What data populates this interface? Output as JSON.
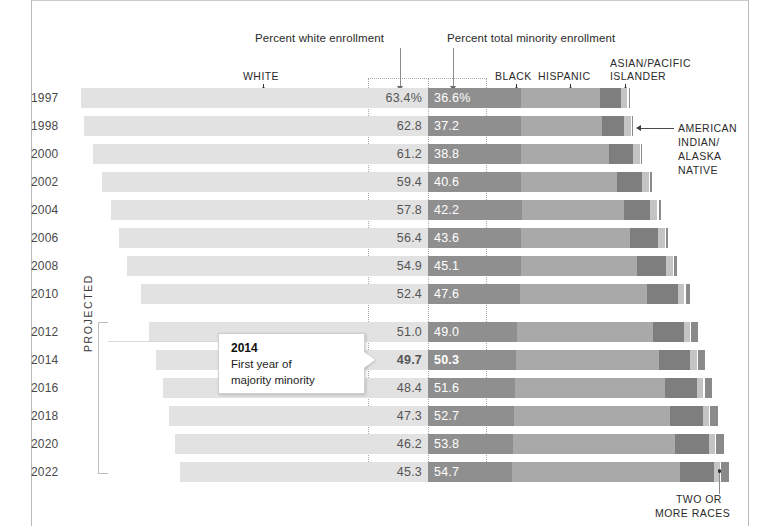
{
  "annotations": {
    "white_enrollment": "Percent white enrollment",
    "minority_enrollment": "Percent total minority enrollment",
    "projected": "PROJECTED",
    "american_indian": "AMERICAN\nINDIAN/\nALASKA\nNATIVE",
    "american_indian_lines": [
      "AMERICAN",
      "INDIAN/",
      "ALASKA",
      "NATIVE"
    ],
    "two_or_more_lines": [
      "TWO OR",
      "MORE RACES"
    ]
  },
  "callout": {
    "title": "2014",
    "line1": "First year of",
    "line2": "majority minority"
  },
  "legend": {
    "white": "WHITE",
    "black": "BLACK",
    "hispanic": "HISPANIC",
    "asian_line1": "ASIAN/PACIFIC",
    "asian_line2": "ISLANDER"
  },
  "colors": {
    "white": "#e2e2e2",
    "black": "#8f8f8f",
    "hispanic": "#a9a9a9",
    "asian": "#7e7e7e",
    "american_indian": "#c4c4c4",
    "two_or_more": "#8a8a8a",
    "background": "#ffffff",
    "text": "#2b2b2b"
  },
  "chart_data": {
    "type": "bar",
    "title": "",
    "xlabel": "",
    "ylabel": "",
    "orientation": "horizontal",
    "stacked": true,
    "grid": false,
    "legend_position": "top",
    "categories": [
      "1997",
      "1998",
      "2000",
      "2002",
      "2004",
      "2006",
      "2008",
      "2010",
      "2012",
      "2014",
      "2016",
      "2018",
      "2020",
      "2022"
    ],
    "projected_categories": [
      "2012",
      "2014",
      "2016",
      "2018",
      "2020",
      "2022"
    ],
    "series": [
      {
        "name": "WHITE",
        "values": [
          63.4,
          62.8,
          61.2,
          59.4,
          57.8,
          56.4,
          54.9,
          52.4,
          51.0,
          49.7,
          48.4,
          47.3,
          46.2,
          45.3
        ]
      },
      {
        "name": "TOTAL MINORITY",
        "values": [
          36.6,
          37.2,
          38.8,
          40.6,
          42.2,
          43.6,
          45.1,
          47.6,
          49.0,
          50.3,
          51.6,
          52.7,
          53.8,
          54.7
        ]
      },
      {
        "name": "BLACK",
        "values": [
          16.9,
          16.9,
          17.0,
          17.0,
          17.1,
          17.0,
          16.9,
          16.7,
          16.3,
          16.1,
          15.9,
          15.7,
          15.5,
          15.3
        ]
      },
      {
        "name": "HISPANIC",
        "values": [
          14.4,
          14.9,
          16.1,
          17.5,
          18.6,
          19.8,
          21.2,
          23.3,
          24.7,
          26.0,
          27.3,
          28.4,
          29.6,
          30.6
        ]
      },
      {
        "name": "ASIAN/PACIFIC ISLANDER",
        "values": [
          3.9,
          4.0,
          4.3,
          4.6,
          4.9,
          5.2,
          5.4,
          5.6,
          5.7,
          5.8,
          5.9,
          6.0,
          6.1,
          6.2
        ]
      },
      {
        "name": "AMERICAN INDIAN/ALASKA NATIVE",
        "values": [
          1.2,
          1.2,
          1.2,
          1.2,
          1.2,
          1.2,
          1.2,
          1.2,
          1.1,
          1.1,
          1.1,
          1.1,
          1.1,
          1.1
        ]
      },
      {
        "name": "TWO OR MORE RACES",
        "values": [
          0.2,
          0.2,
          0.2,
          0.3,
          0.4,
          0.4,
          0.4,
          0.8,
          1.2,
          1.3,
          1.4,
          1.5,
          1.5,
          1.5
        ]
      }
    ],
    "white_labels": [
      "63.4%",
      "62.8",
      "61.2",
      "59.4",
      "57.8",
      "56.4",
      "54.9",
      "52.4",
      "51.0",
      "49.7",
      "48.4",
      "47.3",
      "46.2",
      "45.3"
    ],
    "minority_labels": [
      "36.6%",
      "37.2",
      "38.8",
      "40.6",
      "42.2",
      "43.6",
      "45.1",
      "47.6",
      "49.0",
      "50.3",
      "51.6",
      "52.7",
      "53.8",
      "54.7"
    ],
    "highlight_row": "2014",
    "xlim": [
      0,
      100
    ]
  },
  "rows": [
    {
      "year": "1997",
      "white": "63.4%",
      "minority": "36.6%",
      "w": 63.4,
      "black": 16.9,
      "hisp": 14.4,
      "asian": 3.9,
      "amind": 1.2,
      "two": 0.2,
      "projected": false,
      "bold": false
    },
    {
      "year": "1998",
      "white": "62.8",
      "minority": "37.2",
      "w": 62.8,
      "black": 16.9,
      "hisp": 14.9,
      "asian": 4.0,
      "amind": 1.2,
      "two": 0.2,
      "projected": false,
      "bold": false
    },
    {
      "year": "2000",
      "white": "61.2",
      "minority": "38.8",
      "w": 61.2,
      "black": 17.0,
      "hisp": 16.1,
      "asian": 4.3,
      "amind": 1.2,
      "two": 0.2,
      "projected": false,
      "bold": false
    },
    {
      "year": "2002",
      "white": "59.4",
      "minority": "40.6",
      "w": 59.4,
      "black": 17.0,
      "hisp": 17.5,
      "asian": 4.6,
      "amind": 1.2,
      "two": 0.3,
      "projected": false,
      "bold": false
    },
    {
      "year": "2004",
      "white": "57.8",
      "minority": "42.2",
      "w": 57.8,
      "black": 17.1,
      "hisp": 18.6,
      "asian": 4.9,
      "amind": 1.2,
      "two": 0.4,
      "projected": false,
      "bold": false
    },
    {
      "year": "2006",
      "white": "56.4",
      "minority": "43.6",
      "w": 56.4,
      "black": 17.0,
      "hisp": 19.8,
      "asian": 5.2,
      "amind": 1.2,
      "two": 0.4,
      "projected": false,
      "bold": false
    },
    {
      "year": "2008",
      "white": "54.9",
      "minority": "45.1",
      "w": 54.9,
      "black": 16.9,
      "hisp": 21.2,
      "asian": 5.4,
      "amind": 1.2,
      "two": 0.4,
      "projected": false,
      "bold": false
    },
    {
      "year": "2010",
      "white": "52.4",
      "minority": "47.6",
      "w": 52.4,
      "black": 16.7,
      "hisp": 23.3,
      "asian": 5.6,
      "amind": 1.2,
      "two": 0.8,
      "projected": false,
      "bold": false
    },
    {
      "year": "2012",
      "white": "51.0",
      "minority": "49.0",
      "w": 51.0,
      "black": 16.3,
      "hisp": 24.7,
      "asian": 5.7,
      "amind": 1.1,
      "two": 1.2,
      "projected": true,
      "bold": false
    },
    {
      "year": "2014",
      "white": "49.7",
      "minority": "50.3",
      "w": 49.7,
      "black": 16.1,
      "hisp": 26.0,
      "asian": 5.8,
      "amind": 1.1,
      "two": 1.3,
      "projected": true,
      "bold": true
    },
    {
      "year": "2016",
      "white": "48.4",
      "minority": "51.6",
      "w": 48.4,
      "black": 15.9,
      "hisp": 27.3,
      "asian": 5.9,
      "amind": 1.1,
      "two": 1.4,
      "projected": true,
      "bold": false
    },
    {
      "year": "2018",
      "white": "47.3",
      "minority": "52.7",
      "w": 47.3,
      "black": 15.7,
      "hisp": 28.4,
      "asian": 6.0,
      "amind": 1.1,
      "two": 1.5,
      "projected": true,
      "bold": false
    },
    {
      "year": "2020",
      "white": "46.2",
      "minority": "53.8",
      "w": 46.2,
      "black": 15.5,
      "hisp": 29.6,
      "asian": 6.1,
      "amind": 1.1,
      "two": 1.5,
      "projected": true,
      "bold": false
    },
    {
      "year": "2022",
      "white": "45.3",
      "minority": "54.7",
      "w": 45.3,
      "black": 15.3,
      "hisp": 30.6,
      "asian": 6.2,
      "amind": 1.1,
      "two": 1.5,
      "projected": true,
      "bold": false
    }
  ]
}
